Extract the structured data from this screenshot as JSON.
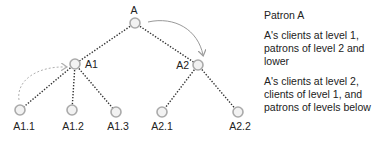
{
  "diagram": {
    "nodes": [
      {
        "id": "A",
        "label": "A",
        "x": 135,
        "y": 23,
        "lx": 134,
        "ly": 14,
        "anchor": "middle"
      },
      {
        "id": "A1",
        "label": "A1",
        "x": 75,
        "y": 64,
        "lx": 85,
        "ly": 68,
        "anchor": "start"
      },
      {
        "id": "A2",
        "label": "A2",
        "x": 198,
        "y": 65,
        "lx": 189,
        "ly": 69,
        "anchor": "end"
      },
      {
        "id": "A1.1",
        "label": "A1.1",
        "x": 20,
        "y": 110,
        "lx": 24,
        "ly": 130,
        "anchor": "middle"
      },
      {
        "id": "A1.2",
        "label": "A1.2",
        "x": 72,
        "y": 110,
        "lx": 73,
        "ly": 130,
        "anchor": "middle"
      },
      {
        "id": "A1.3",
        "label": "A1.3",
        "x": 116,
        "y": 112,
        "lx": 118,
        "ly": 130,
        "anchor": "middle"
      },
      {
        "id": "A2.1",
        "label": "A2.1",
        "x": 162,
        "y": 112,
        "lx": 162,
        "ly": 130,
        "anchor": "middle"
      },
      {
        "id": "A2.2",
        "label": "A2.2",
        "x": 238,
        "y": 112,
        "lx": 240,
        "ly": 130,
        "anchor": "middle"
      }
    ],
    "edges": [
      [
        "A",
        "A1"
      ],
      [
        "A",
        "A2"
      ],
      [
        "A1",
        "A1.1"
      ],
      [
        "A1",
        "A1.2"
      ],
      [
        "A1",
        "A1.3"
      ],
      [
        "A2",
        "A2.1"
      ],
      [
        "A2",
        "A2.2"
      ]
    ],
    "colors": {
      "edge": "#333333",
      "node_stroke": "#aaaaaa",
      "node_fill": "#f2f2f2",
      "arrow_solid": "#999999",
      "arrow_dashed": "#b0b0b0"
    }
  },
  "legend": {
    "title": "Patron A",
    "level1": "A's clients at level 1, patrons of level 2 and lower",
    "level2": "A's clients at level 2, clients of level 1, and patrons of levels below"
  }
}
